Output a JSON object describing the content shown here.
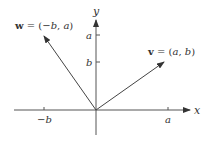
{
  "diagram": {
    "type": "vector-plot",
    "axes": {
      "x_label": "x",
      "y_label": "y"
    },
    "ticks": {
      "x": [
        {
          "label": "−b",
          "value": "-b"
        },
        {
          "label": "a",
          "value": "a"
        }
      ],
      "y": [
        {
          "label": "a",
          "value": "a"
        },
        {
          "label": "b",
          "value": "b"
        }
      ]
    },
    "vectors": [
      {
        "name": "w",
        "label_name": "w",
        "label_eq": " = (",
        "label_x": "−b",
        "label_sep": ", ",
        "label_y": "a",
        "label_close": ")",
        "components": [
          "-b",
          "a"
        ]
      },
      {
        "name": "v",
        "label_name": "v",
        "label_eq": " = (",
        "label_x": "a",
        "label_sep": ", ",
        "label_y": "b",
        "label_close": ")",
        "components": [
          "a",
          "b"
        ]
      }
    ],
    "colors": {
      "line": "#555555",
      "text": "#333333",
      "background": "#ffffff"
    }
  }
}
